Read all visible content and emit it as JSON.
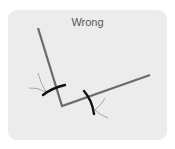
{
  "title": "Wrong",
  "colors": {
    "card_bg": "#ececec",
    "line": "#6b6b6b",
    "marker": "#111111",
    "guide": "#777777"
  },
  "diagram": {
    "polyline": [
      [
        38,
        28
      ],
      [
        62,
        106
      ],
      [
        150,
        75
      ]
    ],
    "markers": [
      {
        "from": [
          43,
          95
        ],
        "to": [
          65,
          85
        ]
      },
      {
        "from": [
          84,
          91
        ],
        "to": [
          95,
          114
        ]
      }
    ]
  }
}
